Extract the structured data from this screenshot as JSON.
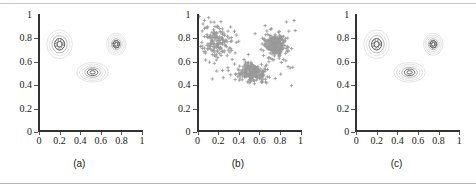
{
  "figure": {
    "caption_a": "(a)",
    "caption_b": "(b)",
    "caption_c": "(c)"
  },
  "axes": {
    "x_ticks": [
      "0",
      "0.2",
      "0.4",
      "0.6",
      "0.8",
      "1"
    ],
    "y_ticks": [
      "1",
      "0.8",
      "0.6",
      "0.4",
      "0.2",
      "0"
    ],
    "xlim": [
      0,
      1
    ],
    "ylim": [
      0,
      1
    ]
  },
  "colors": {
    "axis": "#333333",
    "text": "#1a1a1a",
    "scatter_marker": "#999999",
    "contour_outer": "#d9d9d9",
    "contour_mid": "#a6a6a6",
    "contour_inner": "#555555",
    "rule": "#c8c8c8",
    "background": "#ffffff"
  },
  "chart_data": [
    {
      "type": "contour",
      "panel": "(a)",
      "title": "",
      "xlabel": "",
      "ylabel": "",
      "xlim": [
        0,
        1
      ],
      "ylim": [
        0,
        1
      ],
      "grid": false,
      "legend": "none",
      "components": [
        {
          "name": "cluster-1",
          "cx": 0.2,
          "cy": 0.75,
          "rx": 0.085,
          "ry": 0.085,
          "levels": 5,
          "rotation": 0
        },
        {
          "name": "cluster-2",
          "cx": 0.75,
          "cy": 0.75,
          "rx": 0.065,
          "ry": 0.065,
          "levels": 6,
          "rotation": 0
        },
        {
          "name": "cluster-3",
          "cx": 0.52,
          "cy": 0.51,
          "rx": 0.105,
          "ry": 0.058,
          "levels": 6,
          "rotation": 0
        }
      ]
    },
    {
      "type": "scatter",
      "panel": "(b)",
      "title": "",
      "xlabel": "",
      "ylabel": "",
      "xlim": [
        0,
        1
      ],
      "ylim": [
        0,
        1
      ],
      "grid": false,
      "legend": "none",
      "marker": "plus",
      "marker_color": "#999999",
      "n_points": 600,
      "clusters": [
        {
          "name": "cluster-1",
          "cx": 0.18,
          "cy": 0.76,
          "sx": 0.075,
          "sy": 0.075,
          "n": 160
        },
        {
          "name": "cluster-2",
          "cx": 0.75,
          "cy": 0.74,
          "sx": 0.055,
          "sy": 0.055,
          "n": 230
        },
        {
          "name": "cluster-3",
          "cx": 0.52,
          "cy": 0.51,
          "sx": 0.07,
          "sy": 0.04,
          "n": 210
        }
      ]
    },
    {
      "type": "contour",
      "panel": "(c)",
      "title": "",
      "xlabel": "",
      "ylabel": "",
      "xlim": [
        0,
        1
      ],
      "ylim": [
        0,
        1
      ],
      "grid": false,
      "legend": "none",
      "components": [
        {
          "name": "cluster-1",
          "cx": 0.2,
          "cy": 0.75,
          "rx": 0.085,
          "ry": 0.085,
          "levels": 5,
          "rotation": 0
        },
        {
          "name": "cluster-2",
          "cx": 0.75,
          "cy": 0.75,
          "rx": 0.065,
          "ry": 0.065,
          "levels": 6,
          "rotation": 0
        },
        {
          "name": "cluster-3",
          "cx": 0.52,
          "cy": 0.51,
          "rx": 0.105,
          "ry": 0.058,
          "levels": 6,
          "rotation": 0
        }
      ]
    }
  ]
}
